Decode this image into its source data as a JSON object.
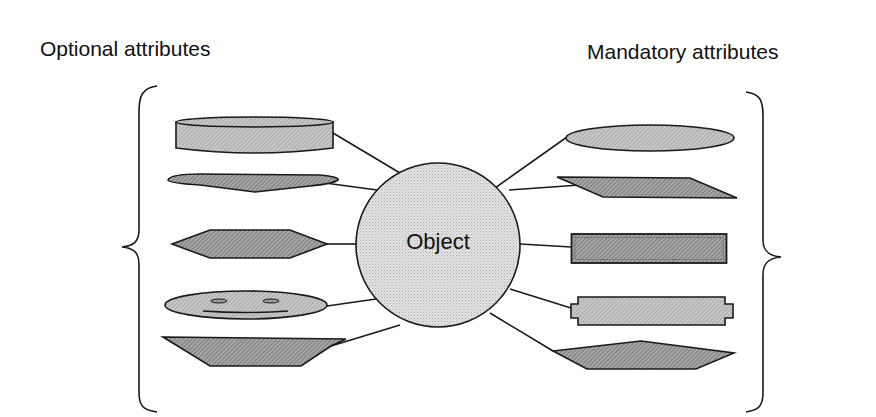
{
  "diagram": {
    "left_heading": "Optional attributes",
    "right_heading": "Mandatory attributes",
    "center": {
      "label": "Object",
      "shape": "circle"
    },
    "left_attributes": [
      {
        "shape": "cylinder"
      },
      {
        "shape": "chevron-dart"
      },
      {
        "shape": "hexagon"
      },
      {
        "shape": "smiley-ellipse"
      },
      {
        "shape": "inverted-trapezoid"
      }
    ],
    "right_attributes": [
      {
        "shape": "ellipse"
      },
      {
        "shape": "parallelogram"
      },
      {
        "shape": "double-border-rectangle"
      },
      {
        "shape": "notched-rectangle"
      },
      {
        "shape": "pentagon"
      }
    ],
    "colors": {
      "stroke": "#1a1a1a",
      "circle_fill": "#d9d9d9",
      "shape_fill_light": "#bdbdbd",
      "shape_fill_dark": "#9a9a9a",
      "background": "#ffffff"
    }
  }
}
